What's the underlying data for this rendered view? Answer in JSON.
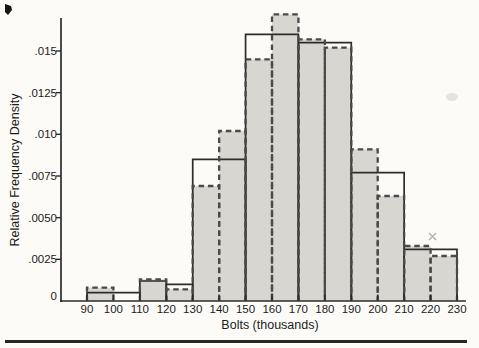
{
  "page": {
    "background": "#fcfbf8",
    "bottom_rule": {
      "color": "#272727",
      "x": 5,
      "y": 340,
      "width": 462,
      "height": 3
    }
  },
  "chart_data": {
    "type": "histogram",
    "title": "",
    "xlabel": "Bolts (thousands)",
    "ylabel": "Relative Frequency Density",
    "x_tick_values": [
      90,
      100,
      110,
      120,
      130,
      140,
      150,
      160,
      170,
      180,
      190,
      200,
      210,
      220,
      230
    ],
    "x_tick_labels": [
      "90",
      "100",
      "110",
      "120",
      "130",
      "140",
      "150",
      "160",
      "170",
      "180",
      "190",
      "200",
      "210",
      "220",
      "230"
    ],
    "y_tick_values": [
      0,
      0.0025,
      0.005,
      0.0075,
      0.01,
      0.0125,
      0.015
    ],
    "y_tick_labels": [
      "0",
      ".0025",
      ".0050",
      ".0075",
      ".010",
      ".0125",
      ".015"
    ],
    "xlim": [
      90,
      230
    ],
    "ylim": [
      0,
      0.017
    ],
    "grid": false,
    "legend_position": "none",
    "series": [
      {
        "name": "equal-width-bins-dashed-filled",
        "style": "dashed-outline-filled",
        "fill": "#d7d6d1",
        "stroke": "#4a4a4a",
        "bin_start": 90,
        "bin_width": 10,
        "densities": [
          0.0008,
          0,
          0.0013,
          0.0007,
          0.0069,
          0.0102,
          0.0145,
          0.0172,
          0.0157,
          0.0152,
          0.0091,
          0.0063,
          0.0033,
          0.0027
        ]
      },
      {
        "name": "unequal-width-bins-solid-outline",
        "style": "solid-outline",
        "stroke": "#2c2c2c",
        "bars": [
          {
            "from": 90,
            "to": 110,
            "density": 0.0005
          },
          {
            "from": 110,
            "to": 120,
            "density": 0.0012
          },
          {
            "from": 120,
            "to": 130,
            "density": 0.001
          },
          {
            "from": 130,
            "to": 150,
            "density": 0.0085
          },
          {
            "from": 150,
            "to": 170,
            "density": 0.016
          },
          {
            "from": 170,
            "to": 190,
            "density": 0.0155
          },
          {
            "from": 190,
            "to": 210,
            "density": 0.0077
          },
          {
            "from": 210,
            "to": 230,
            "density": 0.0031
          }
        ]
      }
    ]
  },
  "artifacts": [
    {
      "type": "ink-blot",
      "x": 5,
      "y": 4
    },
    {
      "type": "x-speckle",
      "x": 432,
      "y": 236
    },
    {
      "type": "smudge",
      "x": 452,
      "y": 97
    }
  ]
}
